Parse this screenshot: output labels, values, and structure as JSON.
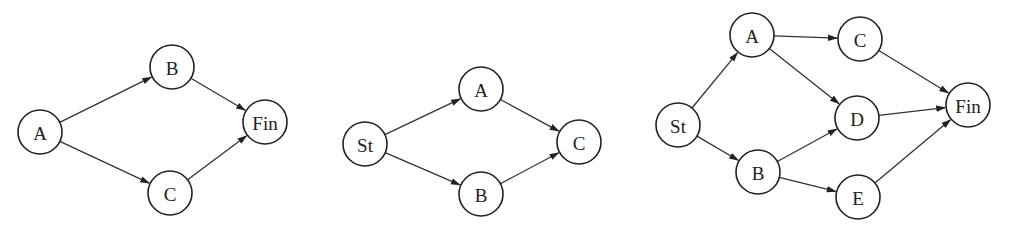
{
  "diagrams": [
    {
      "id": "diagram-1",
      "nodes": [
        {
          "id": "A",
          "label": "A",
          "x": 40,
          "y": 132
        },
        {
          "id": "B",
          "label": "B",
          "x": 172,
          "y": 67
        },
        {
          "id": "C",
          "label": "C",
          "x": 170,
          "y": 193
        },
        {
          "id": "Fin",
          "label": "Fin",
          "x": 265,
          "y": 122
        }
      ],
      "edges": [
        {
          "from": "A",
          "to": "B"
        },
        {
          "from": "A",
          "to": "C"
        },
        {
          "from": "B",
          "to": "Fin"
        },
        {
          "from": "C",
          "to": "Fin"
        }
      ]
    },
    {
      "id": "diagram-2",
      "nodes": [
        {
          "id": "St",
          "label": "St",
          "x": 365,
          "y": 144
        },
        {
          "id": "A",
          "label": "A",
          "x": 481,
          "y": 89
        },
        {
          "id": "B",
          "label": "B",
          "x": 481,
          "y": 194
        },
        {
          "id": "C",
          "label": "C",
          "x": 579,
          "y": 142
        }
      ],
      "edges": [
        {
          "from": "St",
          "to": "A"
        },
        {
          "from": "St",
          "to": "B"
        },
        {
          "from": "A",
          "to": "C"
        },
        {
          "from": "B",
          "to": "C"
        }
      ]
    },
    {
      "id": "diagram-3",
      "nodes": [
        {
          "id": "St",
          "label": "St",
          "x": 678,
          "y": 125
        },
        {
          "id": "A",
          "label": "A",
          "x": 752,
          "y": 35
        },
        {
          "id": "B",
          "label": "B",
          "x": 758,
          "y": 172
        },
        {
          "id": "C",
          "label": "C",
          "x": 860,
          "y": 39
        },
        {
          "id": "D",
          "label": "D",
          "x": 857,
          "y": 118
        },
        {
          "id": "E",
          "label": "E",
          "x": 858,
          "y": 197
        },
        {
          "id": "Fin",
          "label": "Fin",
          "x": 968,
          "y": 105
        }
      ],
      "edges": [
        {
          "from": "St",
          "to": "A"
        },
        {
          "from": "St",
          "to": "B"
        },
        {
          "from": "A",
          "to": "C"
        },
        {
          "from": "A",
          "to": "D"
        },
        {
          "from": "B",
          "to": "D"
        },
        {
          "from": "B",
          "to": "E"
        },
        {
          "from": "C",
          "to": "Fin"
        },
        {
          "from": "D",
          "to": "Fin"
        },
        {
          "from": "E",
          "to": "Fin"
        }
      ]
    }
  ],
  "style": {
    "node_radius": 22,
    "stroke_color": "#222222",
    "background": "#ffffff"
  }
}
